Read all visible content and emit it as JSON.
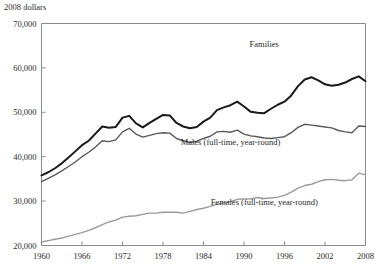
{
  "chart_data": {
    "type": "line",
    "title": "",
    "subtitle": "",
    "units_label": "2008 dollars",
    "xlabel": "",
    "ylabel": "",
    "xlim": [
      1960,
      2008
    ],
    "ylim": [
      20000,
      70000
    ],
    "grid": false,
    "legend_position": "inline-annotations",
    "x_ticks": [
      "1960",
      "1966",
      "1972",
      "1978",
      "1984",
      "1990",
      "1996",
      "2002",
      "2008"
    ],
    "x_tick_values": [
      1960,
      1966,
      1972,
      1978,
      1984,
      1990,
      1996,
      2002,
      2008
    ],
    "y_ticks": [
      "20,000",
      "30,000",
      "40,000",
      "50,000",
      "60,000",
      "70,000"
    ],
    "y_tick_values": [
      20000,
      30000,
      40000,
      50000,
      60000,
      70000
    ],
    "x": [
      1960,
      1961,
      1962,
      1963,
      1964,
      1965,
      1966,
      1967,
      1968,
      1969,
      1970,
      1971,
      1972,
      1973,
      1974,
      1975,
      1976,
      1977,
      1978,
      1979,
      1980,
      1981,
      1982,
      1983,
      1984,
      1985,
      1986,
      1987,
      1988,
      1989,
      1990,
      1991,
      1992,
      1993,
      1994,
      1995,
      1996,
      1997,
      1998,
      1999,
      2000,
      2001,
      2002,
      2003,
      2004,
      2005,
      2006,
      2007,
      2008
    ],
    "series": [
      {
        "name": "Families",
        "color": "#1a1a1a",
        "width": 2.0,
        "label": "Families",
        "label_x": 1993,
        "label_y": 64800,
        "values": [
          35800,
          36500,
          37400,
          38500,
          39800,
          41200,
          42600,
          43600,
          45200,
          46800,
          46500,
          46700,
          48800,
          49200,
          47500,
          46600,
          47600,
          48500,
          49400,
          49300,
          47600,
          46800,
          46400,
          46700,
          47900,
          48800,
          50500,
          51100,
          51600,
          52400,
          51300,
          50100,
          49900,
          49800,
          50800,
          51700,
          52400,
          53800,
          55900,
          57400,
          57900,
          57200,
          56300,
          56000,
          56200,
          56700,
          57500,
          58100,
          57000
        ],
        "note": "Median family income, peaks near 63,500 on rendered curve"
      },
      {
        "name": "Males (full-time, year-round)",
        "color": "#595959",
        "width": 1.4,
        "label": "Males (full-time, year-round)",
        "label_x": 1988,
        "label_y": 42600,
        "values": [
          34400,
          35100,
          35900,
          36800,
          37800,
          38800,
          40000,
          41000,
          42200,
          43600,
          43400,
          43800,
          45600,
          46400,
          45100,
          44400,
          44800,
          45200,
          45400,
          45300,
          44100,
          43600,
          43200,
          43500,
          44100,
          44600,
          45600,
          45700,
          45500,
          46000,
          45100,
          44700,
          44500,
          44200,
          44100,
          44300,
          44500,
          45400,
          46600,
          47300,
          47100,
          46900,
          46700,
          46500,
          45900,
          45600,
          45400,
          46900,
          46800
        ]
      },
      {
        "name": "Females (full-time, year-round)",
        "color": "#9a9a9a",
        "width": 1.4,
        "label": "Females (full-time, year-round)",
        "label_x": 1993,
        "label_y": 29100,
        "values": [
          20800,
          21100,
          21400,
          21700,
          22100,
          22500,
          22900,
          23400,
          24000,
          24700,
          25300,
          25700,
          26400,
          26600,
          26700,
          27000,
          27300,
          27300,
          27500,
          27500,
          27500,
          27300,
          27700,
          28100,
          28400,
          28800,
          29300,
          29600,
          29900,
          30400,
          30500,
          30500,
          30800,
          30600,
          30700,
          30900,
          31300,
          32000,
          32900,
          33500,
          33800,
          34400,
          34800,
          34900,
          34700,
          34600,
          34800,
          36300,
          35900
        ]
      }
    ]
  }
}
